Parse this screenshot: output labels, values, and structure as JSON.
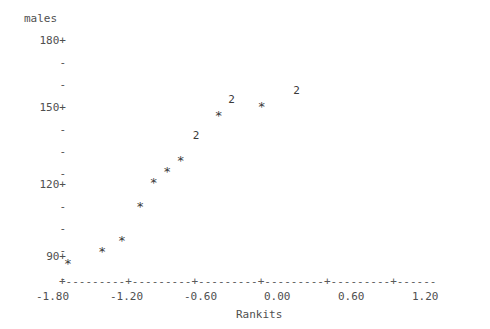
{
  "chart_data": {
    "type": "scatter",
    "title": "",
    "subtitle": "",
    "ylabel": "males",
    "xlabel": "Rankits",
    "grid": false,
    "legend": null,
    "style": "character-plot (Minitab ASCII normal probability plot)",
    "marker_glyph": "*",
    "overplot_glyph": "2",
    "xlim": [
      -1.95,
      1.53
    ],
    "ylim": [
      86,
      184
    ],
    "xticks": [
      -1.8,
      -1.2,
      -0.6,
      0.0,
      0.6,
      1.2
    ],
    "xticklabels": [
      "-1.80",
      "-1.20",
      "-0.60",
      "0.00",
      "0.60",
      "1.20"
    ],
    "yticks": [
      180,
      172.5,
      165,
      157.5,
      150,
      142.5,
      135,
      127.5,
      120,
      112.5,
      105,
      97.5,
      90,
      82.5
    ],
    "yticklabels": [
      "180+",
      "-",
      "-",
      "-",
      "-",
      "150+",
      "-",
      "-",
      "-",
      "-",
      "120+",
      "-",
      "-",
      "-",
      "-",
      "90+",
      "-"
    ],
    "ylabeled_ticks": [
      "180+",
      "150+",
      "120+",
      "90+"
    ],
    "points": [
      {
        "x": -1.76,
        "y": 87.5,
        "glyph": "*",
        "count": 1
      },
      {
        "x": -1.48,
        "y": 92.5,
        "glyph": "*",
        "count": 1
      },
      {
        "x": -1.32,
        "y": 97.0,
        "glyph": "*",
        "count": 1
      },
      {
        "x": -1.17,
        "y": 111.5,
        "glyph": "*",
        "count": 1
      },
      {
        "x": -1.06,
        "y": 121.5,
        "glyph": "*",
        "count": 1
      },
      {
        "x": -0.95,
        "y": 126.5,
        "glyph": "*",
        "count": 1
      },
      {
        "x": -0.84,
        "y": 131.0,
        "glyph": "*",
        "count": 1
      },
      {
        "x": -0.71,
        "y": 139.5,
        "glyph": "2",
        "count": 2
      },
      {
        "x": -0.53,
        "y": 150.0,
        "glyph": "*",
        "count": 1
      },
      {
        "x": -0.42,
        "y": 154.5,
        "glyph": "2",
        "count": 2
      },
      {
        "x": -0.18,
        "y": 154.0,
        "glyph": "*",
        "count": 1
      },
      {
        "x": 0.11,
        "y": 158.5,
        "glyph": "2",
        "count": 2
      }
    ]
  },
  "axis": {
    "y_title": "males",
    "y_labels": [
      "180+",
      "150+",
      "120+",
      "90+"
    ],
    "y_dash": "-",
    "x_title": "Rankits",
    "x_tick_char": "+",
    "x_fill_char": "-",
    "x_axis_line": "+---------+---------+---------+---------+---------+------",
    "x_labels": [
      "-1.80",
      "-1.20",
      "-0.60",
      "0.00",
      "0.60",
      "1.20"
    ]
  },
  "colors": {
    "background": "#ffffff",
    "text": "#4f4f4f",
    "marker": "#3a3a3a",
    "axis": "#5a5a5a"
  }
}
